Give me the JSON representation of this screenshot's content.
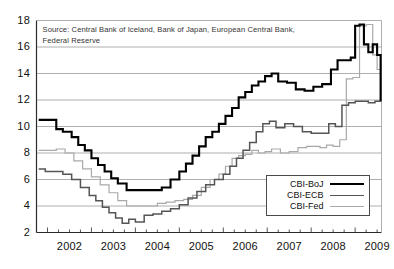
{
  "chart_data": {
    "type": "line",
    "title": "",
    "subtitle": "",
    "xlabel": "",
    "ylabel": "",
    "source_note": "Source: Central Bank of Iceland, Bank of Japan, European Central Bank, Federal Reserve",
    "grid": true,
    "legend_position": "bottom-right",
    "step_style": "step-post",
    "xlim": [
      2001.75,
      2009.6
    ],
    "ylim": [
      2,
      18
    ],
    "ytick_labels": [
      "2",
      "4",
      "6",
      "8",
      "10",
      "12",
      "14",
      "16",
      "18"
    ],
    "ytick_values": [
      2,
      4,
      6,
      8,
      10,
      12,
      14,
      16,
      18
    ],
    "xtick_labels": [
      "2002",
      "2003",
      "2004",
      "2005",
      "2006",
      "2007",
      "2008",
      "2009"
    ],
    "xtick_values": [
      2002,
      2003,
      2004,
      2005,
      2006,
      2007,
      2008,
      2009
    ],
    "x_minor_tick_interval": 0.25,
    "colors": {
      "cbi_boj": "#000000",
      "cbi_ecb": "#555555",
      "cbi_fed": "#a9a9a9",
      "grid": "#9a9a9a",
      "axis": "#2b2b2b",
      "background": "#ffffff"
    },
    "series": [
      {
        "name": "CBI-BoJ",
        "color": "#000000",
        "x": [
          2001.8,
          2002.05,
          2002.2,
          2002.35,
          2002.55,
          2002.7,
          2002.85,
          2003.0,
          2003.15,
          2003.3,
          2003.45,
          2003.6,
          2003.8,
          2004.3,
          2004.6,
          2004.8,
          2005.0,
          2005.15,
          2005.3,
          2005.45,
          2005.6,
          2005.75,
          2005.9,
          2006.05,
          2006.2,
          2006.35,
          2006.5,
          2006.65,
          2006.8,
          2006.95,
          2007.1,
          2007.25,
          2007.45,
          2007.65,
          2007.85,
          2008.05,
          2008.25,
          2008.45,
          2008.6,
          2008.75,
          2008.9,
          2009.0,
          2009.1,
          2009.2,
          2009.3,
          2009.4,
          2009.5,
          2009.58
        ],
        "y": [
          10.5,
          10.5,
          9.8,
          9.6,
          9.2,
          8.6,
          8.2,
          7.6,
          7.1,
          6.6,
          6.1,
          5.7,
          5.2,
          5.2,
          5.4,
          6.0,
          6.6,
          7.2,
          7.8,
          8.5,
          9.2,
          9.6,
          10.2,
          10.8,
          11.4,
          12.2,
          12.6,
          13.1,
          13.4,
          13.8,
          14.0,
          13.4,
          13.3,
          12.8,
          12.7,
          13.0,
          13.2,
          14.3,
          15.0,
          15.0,
          15.2,
          17.6,
          17.7,
          16.2,
          15.6,
          16.2,
          15.4,
          12.0
        ]
      },
      {
        "name": "CBI-ECB",
        "color": "#555555",
        "x": [
          2001.8,
          2001.95,
          2002.15,
          2002.35,
          2002.55,
          2002.75,
          2002.95,
          2003.1,
          2003.25,
          2003.4,
          2003.55,
          2003.7,
          2003.85,
          2004.0,
          2004.2,
          2004.4,
          2004.6,
          2004.8,
          2005.0,
          2005.2,
          2005.4,
          2005.6,
          2005.8,
          2006.0,
          2006.15,
          2006.3,
          2006.45,
          2006.6,
          2006.75,
          2006.9,
          2007.05,
          2007.2,
          2007.4,
          2007.6,
          2007.8,
          2008.0,
          2008.2,
          2008.4,
          2008.55,
          2008.7,
          2008.85,
          2009.0,
          2009.15,
          2009.3,
          2009.45,
          2009.58
        ],
        "y": [
          6.8,
          6.6,
          6.6,
          6.4,
          6.0,
          5.4,
          4.8,
          4.4,
          3.9,
          3.5,
          3.1,
          2.7,
          3.0,
          2.8,
          3.3,
          3.4,
          3.6,
          3.8,
          4.1,
          4.6,
          5.1,
          5.6,
          6.0,
          6.4,
          7.0,
          7.6,
          8.2,
          8.8,
          9.6,
          10.2,
          10.4,
          9.9,
          10.2,
          10.0,
          9.6,
          9.5,
          9.5,
          10.2,
          10.0,
          11.6,
          11.8,
          11.9,
          11.9,
          11.8,
          11.9,
          11.9
        ]
      },
      {
        "name": "CBI-Fed",
        "color": "#a9a9a9",
        "x": [
          2001.8,
          2002.0,
          2002.2,
          2002.4,
          2002.6,
          2002.8,
          2003.0,
          2003.2,
          2003.4,
          2003.6,
          2003.8,
          2004.0,
          2004.25,
          2004.5,
          2004.7,
          2004.9,
          2005.1,
          2005.3,
          2005.5,
          2005.7,
          2005.9,
          2006.05,
          2006.2,
          2006.35,
          2006.5,
          2006.65,
          2006.8,
          2006.95,
          2007.1,
          2007.3,
          2007.5,
          2007.7,
          2007.9,
          2008.05,
          2008.2,
          2008.35,
          2008.5,
          2008.65,
          2008.8,
          2008.95,
          2009.1,
          2009.25,
          2009.4,
          2009.5,
          2009.58
        ],
        "y": [
          8.2,
          8.2,
          8.3,
          8.0,
          7.4,
          6.8,
          6.2,
          5.6,
          5.0,
          4.4,
          4.0,
          4.0,
          4.0,
          4.2,
          4.3,
          4.4,
          4.5,
          4.8,
          5.4,
          6.0,
          6.4,
          7.0,
          7.6,
          7.8,
          7.9,
          8.2,
          8.0,
          8.1,
          8.3,
          8.0,
          8.1,
          8.4,
          8.5,
          8.5,
          8.4,
          8.6,
          8.5,
          9.0,
          13.6,
          13.7,
          17.6,
          17.7,
          15.4,
          14.3,
          11.9
        ]
      }
    ]
  },
  "legend": {
    "items": [
      {
        "label": "CBI-BoJ"
      },
      {
        "label": "CBI-ECB"
      },
      {
        "label": "CBI-Fed"
      }
    ]
  }
}
